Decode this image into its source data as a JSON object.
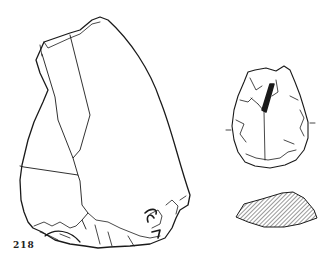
{
  "figure": {
    "number_label": "218",
    "items": [
      {
        "name": "large-flake-drawing",
        "description": "lithic flake, dorsal view"
      },
      {
        "name": "small-tool-drawing",
        "description": "retouched tool, dorsal view"
      },
      {
        "name": "cross-section",
        "description": "hatched cross-section"
      }
    ]
  },
  "colors": {
    "ink": "#1a1a1a",
    "background": "#ffffff"
  }
}
